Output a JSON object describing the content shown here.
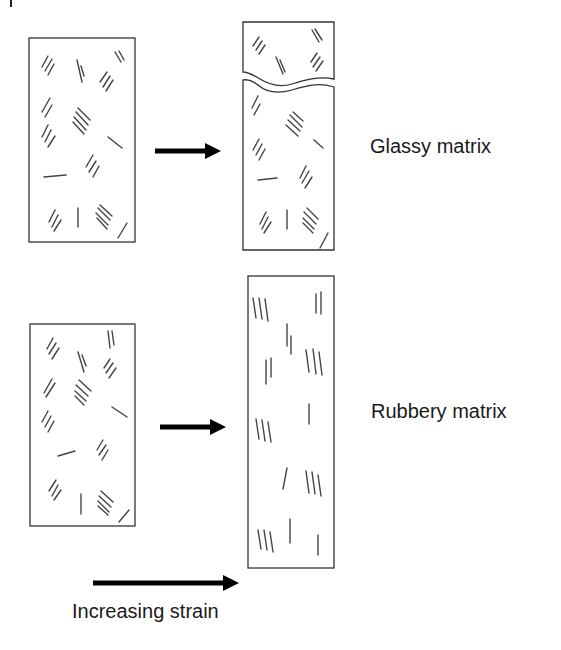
{
  "diagram": {
    "rows": [
      {
        "label": "Glassy matrix",
        "before": "unstrained specimen with randomly oriented fibril bundles",
        "after": "fractured specimen (brittle crack across upper portion), fibrils keep random orientation"
      },
      {
        "label": "Rubbery matrix",
        "before": "unstrained specimen with randomly oriented fibril bundles",
        "after": "elongated specimen, fibrils aligned along strain direction (vertical)"
      }
    ],
    "legend": {
      "arrow_label": "Increasing strain"
    },
    "colors": {
      "line": "#333333",
      "arrow": "#000000",
      "text": "#1a1a1a",
      "background": "#ffffff"
    }
  }
}
